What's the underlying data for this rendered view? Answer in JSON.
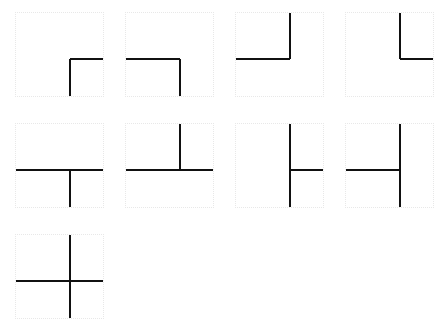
{
  "figure": {
    "title": "",
    "background_color": "#ffffff",
    "stroke_color": "#111111",
    "border_color": "#e8e8e8",
    "stroke_width_px": 2,
    "cell_width_px": 89,
    "cell_height_px": 85,
    "columns": 4,
    "rows": 3,
    "cell_count": 9,
    "center_x_fraction": 0.62,
    "center_y_fraction": 0.55
  },
  "chart_data": {
    "type": "diagram-grid",
    "title": "",
    "xlabel": "",
    "ylabel": "",
    "legend": [],
    "cells": [
      {
        "index": 1,
        "row": 1,
        "column": 1,
        "x": 15,
        "y": 12,
        "label": "corner-right-down",
        "arms": [
          "right",
          "down"
        ],
        "arm_count": 2
      },
      {
        "index": 2,
        "row": 1,
        "column": 2,
        "x": 125,
        "y": 12,
        "label": "corner-left-down",
        "arms": [
          "left",
          "down"
        ],
        "arm_count": 2
      },
      {
        "index": 3,
        "row": 1,
        "column": 3,
        "x": 235,
        "y": 12,
        "label": "corner-left-up",
        "arms": [
          "left",
          "up"
        ],
        "arm_count": 2
      },
      {
        "index": 4,
        "row": 1,
        "column": 4,
        "x": 345,
        "y": 12,
        "label": "corner-right-up",
        "arms": [
          "right",
          "up"
        ],
        "arm_count": 2
      },
      {
        "index": 5,
        "row": 2,
        "column": 1,
        "x": 15,
        "y": 123,
        "label": "tee-down",
        "arms": [
          "left",
          "right",
          "down"
        ],
        "arm_count": 3
      },
      {
        "index": 6,
        "row": 2,
        "column": 2,
        "x": 125,
        "y": 123,
        "label": "tee-up",
        "arms": [
          "left",
          "right",
          "up"
        ],
        "arm_count": 3
      },
      {
        "index": 7,
        "row": 2,
        "column": 3,
        "x": 235,
        "y": 123,
        "label": "tee-right",
        "arms": [
          "up",
          "down",
          "right"
        ],
        "arm_count": 3
      },
      {
        "index": 8,
        "row": 2,
        "column": 4,
        "x": 345,
        "y": 123,
        "label": "tee-left",
        "arms": [
          "up",
          "down",
          "left"
        ],
        "arm_count": 3
      },
      {
        "index": 9,
        "row": 3,
        "column": 1,
        "x": 15,
        "y": 234,
        "label": "cross-four-way",
        "arms": [
          "left",
          "right",
          "up",
          "down"
        ],
        "arm_count": 4
      }
    ]
  }
}
